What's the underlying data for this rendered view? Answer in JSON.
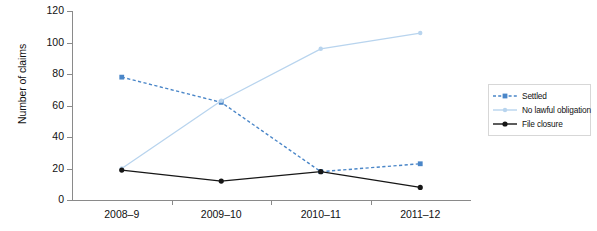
{
  "chart": {
    "type": "line",
    "ylabel": "Number of claims",
    "xlabel": "",
    "title": "",
    "grid": false,
    "legend_position": "right"
  },
  "axes": {
    "y_ticks": [
      "0",
      "20",
      "40",
      "60",
      "80",
      "100",
      "120"
    ],
    "y_min": 0,
    "y_max": 120,
    "x_ticks": [
      "2008–9",
      "2009–10",
      "2010–11",
      "2011–12"
    ]
  },
  "legend": {
    "items": [
      {
        "label": "Settled",
        "color": "#4a86c8",
        "style": "dashed",
        "marker": "square"
      },
      {
        "label": "No lawful obligation",
        "color": "#b8d4ee",
        "style": "solid",
        "marker": "circle"
      },
      {
        "label": "File closure",
        "color": "#161616",
        "style": "solid",
        "marker": "circle"
      }
    ]
  },
  "chart_data": {
    "type": "line",
    "title": "",
    "xlabel": "",
    "ylabel": "Number of claims",
    "ylim": [
      0,
      120
    ],
    "yticks": [
      0,
      20,
      40,
      60,
      80,
      100,
      120
    ],
    "grid": false,
    "legend_position": "right",
    "categories": [
      "2008–9",
      "2009–10",
      "2010–11",
      "2011–12"
    ],
    "series": [
      {
        "name": "Settled",
        "color": "#4a86c8",
        "linestyle": "dashed",
        "marker": "square",
        "values": [
          78,
          62,
          18,
          23
        ]
      },
      {
        "name": "No lawful obligation",
        "color": "#b8d4ee",
        "linestyle": "solid",
        "marker": "circle",
        "values": [
          20,
          63,
          96,
          106
        ]
      },
      {
        "name": "File closure",
        "color": "#161616",
        "linestyle": "solid",
        "marker": "circle",
        "values": [
          19,
          12,
          18,
          8
        ]
      }
    ]
  },
  "caption": ""
}
